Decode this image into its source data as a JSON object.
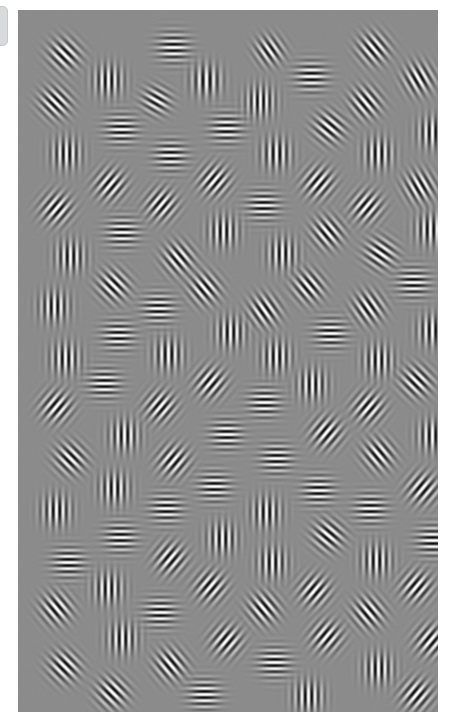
{
  "app": {
    "title": "Gabor Patch Stimulus Display",
    "screen_width": 458,
    "screen_height": 719
  },
  "edge_tab": {
    "name": "drawer-handle",
    "fill_color": "#d9dade",
    "border_color": "#c6c8cc",
    "x": -6,
    "y": 6,
    "width": 14,
    "height": 40,
    "radius": 5
  },
  "stimulus": {
    "name": "gabor-field",
    "x": 18,
    "y": 10,
    "width": 420,
    "height": 702,
    "background_color": "#8b8b8b",
    "background_luminance": 139,
    "contrast": 0.95,
    "patch_sigma": 9.5,
    "patch_wavelength": 7.0,
    "patch_count": 96,
    "orientation_unit": "degrees_clockwise_from_vertical",
    "note": "Jittered grid of oriented Gabor patches (sinusoidal grating x Gaussian envelope) on uniform mid-gray field.",
    "patches": [
      {
        "x": 46,
        "y": 44,
        "deg": 135,
        "sigma": 10,
        "lambda": 7.0,
        "contrast": 0.95,
        "phase": 0
      },
      {
        "x": 155,
        "y": 37,
        "deg": 90,
        "sigma": 10,
        "lambda": 6.4,
        "contrast": 0.95,
        "phase": 0
      },
      {
        "x": 251,
        "y": 40,
        "deg": 145,
        "sigma": 9,
        "lambda": 6.6,
        "contrast": 0.9,
        "phase": 0
      },
      {
        "x": 355,
        "y": 38,
        "deg": 140,
        "sigma": 10,
        "lambda": 6.8,
        "contrast": 0.95,
        "phase": 0
      },
      {
        "x": 90,
        "y": 70,
        "deg": 0,
        "sigma": 10,
        "lambda": 6.6,
        "contrast": 0.95,
        "phase": 0
      },
      {
        "x": 188,
        "y": 70,
        "deg": 0,
        "sigma": 10,
        "lambda": 7.2,
        "contrast": 0.95,
        "phase": 0
      },
      {
        "x": 293,
        "y": 66,
        "deg": 90,
        "sigma": 10,
        "lambda": 6.6,
        "contrast": 0.95,
        "phase": 0
      },
      {
        "x": 400,
        "y": 68,
        "deg": 150,
        "sigma": 10,
        "lambda": 6.8,
        "contrast": 0.95,
        "phase": 0
      },
      {
        "x": 37,
        "y": 92,
        "deg": 135,
        "sigma": 10,
        "lambda": 6.6,
        "contrast": 0.95,
        "phase": 0
      },
      {
        "x": 138,
        "y": 90,
        "deg": 120,
        "sigma": 9,
        "lambda": 6.6,
        "contrast": 0.9,
        "phase": 0
      },
      {
        "x": 242,
        "y": 91,
        "deg": 0,
        "sigma": 10,
        "lambda": 6.2,
        "contrast": 0.95,
        "phase": 0
      },
      {
        "x": 347,
        "y": 92,
        "deg": 140,
        "sigma": 10,
        "lambda": 6.8,
        "contrast": 0.95,
        "phase": 0
      },
      {
        "x": 103,
        "y": 119,
        "deg": 90,
        "sigma": 10,
        "lambda": 6.2,
        "contrast": 0.95,
        "phase": 0
      },
      {
        "x": 208,
        "y": 118,
        "deg": 90,
        "sigma": 10,
        "lambda": 6.4,
        "contrast": 0.95,
        "phase": 0
      },
      {
        "x": 311,
        "y": 117,
        "deg": 130,
        "sigma": 10,
        "lambda": 6.8,
        "contrast": 0.95,
        "phase": 0
      },
      {
        "x": 414,
        "y": 122,
        "deg": 0,
        "sigma": 10,
        "lambda": 6.6,
        "contrast": 0.95,
        "phase": 0
      },
      {
        "x": 48,
        "y": 143,
        "deg": 0,
        "sigma": 10,
        "lambda": 6.6,
        "contrast": 0.95,
        "phase": 0
      },
      {
        "x": 152,
        "y": 145,
        "deg": 90,
        "sigma": 10,
        "lambda": 6.4,
        "contrast": 0.95,
        "phase": 0
      },
      {
        "x": 258,
        "y": 143,
        "deg": 0,
        "sigma": 10,
        "lambda": 6.8,
        "contrast": 0.95,
        "phase": 0
      },
      {
        "x": 360,
        "y": 143,
        "deg": 0,
        "sigma": 10,
        "lambda": 6.8,
        "contrast": 0.95,
        "phase": 0
      },
      {
        "x": 92,
        "y": 174,
        "deg": 40,
        "sigma": 10,
        "lambda": 6.8,
        "contrast": 0.95,
        "phase": 0
      },
      {
        "x": 196,
        "y": 170,
        "deg": 40,
        "sigma": 10,
        "lambda": 6.6,
        "contrast": 0.95,
        "phase": 0
      },
      {
        "x": 300,
        "y": 172,
        "deg": 40,
        "sigma": 10,
        "lambda": 6.8,
        "contrast": 0.95,
        "phase": 0
      },
      {
        "x": 401,
        "y": 176,
        "deg": 150,
        "sigma": 10,
        "lambda": 6.6,
        "contrast": 0.95,
        "phase": 0
      },
      {
        "x": 38,
        "y": 198,
        "deg": 40,
        "sigma": 10,
        "lambda": 6.8,
        "contrast": 0.95,
        "phase": 0
      },
      {
        "x": 143,
        "y": 194,
        "deg": 40,
        "sigma": 10,
        "lambda": 6.6,
        "contrast": 0.95,
        "phase": 0
      },
      {
        "x": 245,
        "y": 195,
        "deg": 90,
        "sigma": 10,
        "lambda": 6.2,
        "contrast": 0.95,
        "phase": 0
      },
      {
        "x": 348,
        "y": 196,
        "deg": 40,
        "sigma": 10,
        "lambda": 6.8,
        "contrast": 0.95,
        "phase": 0
      },
      {
        "x": 104,
        "y": 222,
        "deg": 90,
        "sigma": 10,
        "lambda": 6.2,
        "contrast": 0.95,
        "phase": 0
      },
      {
        "x": 205,
        "y": 221,
        "deg": 0,
        "sigma": 10,
        "lambda": 6.6,
        "contrast": 0.95,
        "phase": 0
      },
      {
        "x": 309,
        "y": 222,
        "deg": 140,
        "sigma": 10,
        "lambda": 6.8,
        "contrast": 0.95,
        "phase": 0
      },
      {
        "x": 412,
        "y": 219,
        "deg": 0,
        "sigma": 10,
        "lambda": 6.6,
        "contrast": 0.95,
        "phase": 0
      },
      {
        "x": 52,
        "y": 246,
        "deg": 0,
        "sigma": 10,
        "lambda": 6.6,
        "contrast": 0.95,
        "phase": 0
      },
      {
        "x": 160,
        "y": 248,
        "deg": 140,
        "sigma": 10,
        "lambda": 6.8,
        "contrast": 0.95,
        "phase": 0
      },
      {
        "x": 264,
        "y": 243,
        "deg": 0,
        "sigma": 10,
        "lambda": 6.6,
        "contrast": 0.95,
        "phase": 0
      },
      {
        "x": 362,
        "y": 243,
        "deg": 125,
        "sigma": 10,
        "lambda": 6.8,
        "contrast": 0.95,
        "phase": 0
      },
      {
        "x": 95,
        "y": 275,
        "deg": 135,
        "sigma": 10,
        "lambda": 6.8,
        "contrast": 0.95,
        "phase": 0
      },
      {
        "x": 186,
        "y": 278,
        "deg": 140,
        "sigma": 10,
        "lambda": 6.8,
        "contrast": 0.95,
        "phase": 0
      },
      {
        "x": 290,
        "y": 276,
        "deg": 140,
        "sigma": 10,
        "lambda": 6.8,
        "contrast": 0.95,
        "phase": 0
      },
      {
        "x": 395,
        "y": 272,
        "deg": 90,
        "sigma": 10,
        "lambda": 6.2,
        "contrast": 0.95,
        "phase": 0
      },
      {
        "x": 36,
        "y": 296,
        "deg": 0,
        "sigma": 10,
        "lambda": 6.6,
        "contrast": 0.95,
        "phase": 0
      },
      {
        "x": 140,
        "y": 298,
        "deg": 90,
        "sigma": 10,
        "lambda": 6.2,
        "contrast": 0.95,
        "phase": 0
      },
      {
        "x": 246,
        "y": 300,
        "deg": 145,
        "sigma": 10,
        "lambda": 6.8,
        "contrast": 0.95,
        "phase": 0
      },
      {
        "x": 350,
        "y": 297,
        "deg": 145,
        "sigma": 10,
        "lambda": 6.8,
        "contrast": 0.95,
        "phase": 0
      },
      {
        "x": 100,
        "y": 325,
        "deg": 90,
        "sigma": 10,
        "lambda": 6.2,
        "contrast": 0.95,
        "phase": 0
      },
      {
        "x": 212,
        "y": 322,
        "deg": 0,
        "sigma": 10,
        "lambda": 6.6,
        "contrast": 0.95,
        "phase": 0
      },
      {
        "x": 312,
        "y": 323,
        "deg": 90,
        "sigma": 10,
        "lambda": 6.2,
        "contrast": 0.95,
        "phase": 0
      },
      {
        "x": 414,
        "y": 320,
        "deg": 0,
        "sigma": 10,
        "lambda": 6.6,
        "contrast": 0.95,
        "phase": 0
      },
      {
        "x": 47,
        "y": 348,
        "deg": 0,
        "sigma": 10,
        "lambda": 6.6,
        "contrast": 0.95,
        "phase": 0
      },
      {
        "x": 150,
        "y": 344,
        "deg": 0,
        "sigma": 10,
        "lambda": 6.8,
        "contrast": 0.95,
        "phase": 0
      },
      {
        "x": 258,
        "y": 346,
        "deg": 0,
        "sigma": 10,
        "lambda": 6.6,
        "contrast": 0.95,
        "phase": 0
      },
      {
        "x": 360,
        "y": 350,
        "deg": 0,
        "sigma": 10,
        "lambda": 6.6,
        "contrast": 0.95,
        "phase": 0
      },
      {
        "x": 86,
        "y": 373,
        "deg": 90,
        "sigma": 10,
        "lambda": 6.2,
        "contrast": 0.95,
        "phase": 0
      },
      {
        "x": 192,
        "y": 372,
        "deg": 40,
        "sigma": 10,
        "lambda": 6.8,
        "contrast": 0.95,
        "phase": 0
      },
      {
        "x": 294,
        "y": 374,
        "deg": 0,
        "sigma": 10,
        "lambda": 6.6,
        "contrast": 0.95,
        "phase": 0
      },
      {
        "x": 398,
        "y": 371,
        "deg": 135,
        "sigma": 10,
        "lambda": 6.8,
        "contrast": 0.95,
        "phase": 0
      },
      {
        "x": 38,
        "y": 396,
        "deg": 40,
        "sigma": 10,
        "lambda": 6.8,
        "contrast": 0.95,
        "phase": 0
      },
      {
        "x": 142,
        "y": 396,
        "deg": 40,
        "sigma": 10,
        "lambda": 6.6,
        "contrast": 0.95,
        "phase": 0
      },
      {
        "x": 246,
        "y": 392,
        "deg": 90,
        "sigma": 10,
        "lambda": 6.2,
        "contrast": 0.95,
        "phase": 0
      },
      {
        "x": 350,
        "y": 397,
        "deg": 40,
        "sigma": 10,
        "lambda": 6.8,
        "contrast": 0.95,
        "phase": 0
      },
      {
        "x": 106,
        "y": 425,
        "deg": 0,
        "sigma": 10,
        "lambda": 6.6,
        "contrast": 0.95,
        "phase": 0
      },
      {
        "x": 208,
        "y": 424,
        "deg": 90,
        "sigma": 10,
        "lambda": 6.2,
        "contrast": 0.95,
        "phase": 0
      },
      {
        "x": 308,
        "y": 422,
        "deg": 40,
        "sigma": 10,
        "lambda": 6.8,
        "contrast": 0.95,
        "phase": 0
      },
      {
        "x": 414,
        "y": 425,
        "deg": 0,
        "sigma": 10,
        "lambda": 6.6,
        "contrast": 0.95,
        "phase": 0
      },
      {
        "x": 52,
        "y": 448,
        "deg": 135,
        "sigma": 10,
        "lambda": 6.8,
        "contrast": 0.95,
        "phase": 0
      },
      {
        "x": 155,
        "y": 450,
        "deg": 40,
        "sigma": 10,
        "lambda": 6.8,
        "contrast": 0.95,
        "phase": 0
      },
      {
        "x": 258,
        "y": 448,
        "deg": 90,
        "sigma": 10,
        "lambda": 6.2,
        "contrast": 0.95,
        "phase": 0
      },
      {
        "x": 360,
        "y": 444,
        "deg": 140,
        "sigma": 10,
        "lambda": 6.8,
        "contrast": 0.95,
        "phase": 0
      },
      {
        "x": 96,
        "y": 478,
        "deg": 0,
        "sigma": 10,
        "lambda": 6.6,
        "contrast": 0.95,
        "phase": 0
      },
      {
        "x": 196,
        "y": 476,
        "deg": 90,
        "sigma": 10,
        "lambda": 6.2,
        "contrast": 0.95,
        "phase": 0
      },
      {
        "x": 300,
        "y": 480,
        "deg": 90,
        "sigma": 10,
        "lambda": 6.2,
        "contrast": 0.95,
        "phase": 0
      },
      {
        "x": 404,
        "y": 478,
        "deg": 40,
        "sigma": 10,
        "lambda": 6.8,
        "contrast": 0.95,
        "phase": 0
      },
      {
        "x": 38,
        "y": 500,
        "deg": 0,
        "sigma": 10,
        "lambda": 6.6,
        "contrast": 0.95,
        "phase": 0
      },
      {
        "x": 148,
        "y": 498,
        "deg": 90,
        "sigma": 10,
        "lambda": 6.2,
        "contrast": 0.95,
        "phase": 0
      },
      {
        "x": 248,
        "y": 502,
        "deg": 0,
        "sigma": 10,
        "lambda": 6.6,
        "contrast": 0.95,
        "phase": 0
      },
      {
        "x": 352,
        "y": 498,
        "deg": 90,
        "sigma": 10,
        "lambda": 6.2,
        "contrast": 0.95,
        "phase": 0
      },
      {
        "x": 102,
        "y": 527,
        "deg": 90,
        "sigma": 10,
        "lambda": 6.2,
        "contrast": 0.95,
        "phase": 0
      },
      {
        "x": 204,
        "y": 528,
        "deg": 0,
        "sigma": 10,
        "lambda": 6.6,
        "contrast": 0.95,
        "phase": 0
      },
      {
        "x": 310,
        "y": 525,
        "deg": 130,
        "sigma": 10,
        "lambda": 6.8,
        "contrast": 0.95,
        "phase": 0
      },
      {
        "x": 414,
        "y": 530,
        "deg": 90,
        "sigma": 10,
        "lambda": 6.2,
        "contrast": 0.95,
        "phase": 0
      },
      {
        "x": 50,
        "y": 552,
        "deg": 90,
        "sigma": 10,
        "lambda": 6.2,
        "contrast": 0.95,
        "phase": 0
      },
      {
        "x": 152,
        "y": 548,
        "deg": 40,
        "sigma": 10,
        "lambda": 6.8,
        "contrast": 0.95,
        "phase": 0
      },
      {
        "x": 254,
        "y": 552,
        "deg": 0,
        "sigma": 10,
        "lambda": 6.6,
        "contrast": 0.95,
        "phase": 0
      },
      {
        "x": 358,
        "y": 550,
        "deg": 0,
        "sigma": 10,
        "lambda": 6.6,
        "contrast": 0.95,
        "phase": 0
      },
      {
        "x": 90,
        "y": 578,
        "deg": 0,
        "sigma": 10,
        "lambda": 6.6,
        "contrast": 0.95,
        "phase": 0
      },
      {
        "x": 192,
        "y": 576,
        "deg": 40,
        "sigma": 10,
        "lambda": 6.8,
        "contrast": 0.95,
        "phase": 0
      },
      {
        "x": 296,
        "y": 580,
        "deg": 40,
        "sigma": 10,
        "lambda": 6.8,
        "contrast": 0.95,
        "phase": 0
      },
      {
        "x": 398,
        "y": 576,
        "deg": 40,
        "sigma": 10,
        "lambda": 6.8,
        "contrast": 0.95,
        "phase": 0
      },
      {
        "x": 38,
        "y": 598,
        "deg": 140,
        "sigma": 10,
        "lambda": 6.8,
        "contrast": 0.95,
        "phase": 0
      },
      {
        "x": 142,
        "y": 602,
        "deg": 90,
        "sigma": 10,
        "lambda": 6.2,
        "contrast": 0.95,
        "phase": 0
      },
      {
        "x": 245,
        "y": 598,
        "deg": 140,
        "sigma": 10,
        "lambda": 6.8,
        "contrast": 0.95,
        "phase": 0
      },
      {
        "x": 350,
        "y": 602,
        "deg": 140,
        "sigma": 10,
        "lambda": 6.8,
        "contrast": 0.95,
        "phase": 0
      },
      {
        "x": 104,
        "y": 628,
        "deg": 0,
        "sigma": 10,
        "lambda": 6.6,
        "contrast": 0.95,
        "phase": 0
      },
      {
        "x": 208,
        "y": 630,
        "deg": 40,
        "sigma": 10,
        "lambda": 6.8,
        "contrast": 0.95,
        "phase": 0
      },
      {
        "x": 308,
        "y": 626,
        "deg": 40,
        "sigma": 10,
        "lambda": 6.8,
        "contrast": 0.95,
        "phase": 0
      },
      {
        "x": 412,
        "y": 630,
        "deg": 40,
        "sigma": 10,
        "lambda": 6.8,
        "contrast": 0.95,
        "phase": 0
      },
      {
        "x": 46,
        "y": 656,
        "deg": 135,
        "sigma": 10,
        "lambda": 6.8,
        "contrast": 0.95,
        "phase": 0
      },
      {
        "x": 152,
        "y": 654,
        "deg": 140,
        "sigma": 10,
        "lambda": 6.8,
        "contrast": 0.95,
        "phase": 0
      },
      {
        "x": 256,
        "y": 652,
        "deg": 90,
        "sigma": 10,
        "lambda": 6.2,
        "contrast": 0.95,
        "phase": 0
      },
      {
        "x": 360,
        "y": 658,
        "deg": 0,
        "sigma": 10,
        "lambda": 6.6,
        "contrast": 0.95,
        "phase": 0
      },
      {
        "x": 94,
        "y": 682,
        "deg": 135,
        "sigma": 10,
        "lambda": 6.8,
        "contrast": 0.95,
        "phase": 0
      },
      {
        "x": 186,
        "y": 684,
        "deg": 90,
        "sigma": 10,
        "lambda": 6.2,
        "contrast": 0.95,
        "phase": 0
      },
      {
        "x": 290,
        "y": 686,
        "deg": 0,
        "sigma": 10,
        "lambda": 6.6,
        "contrast": 0.95,
        "phase": 0
      },
      {
        "x": 398,
        "y": 684,
        "deg": 40,
        "sigma": 10,
        "lambda": 6.8,
        "contrast": 0.95,
        "phase": 0
      }
    ]
  }
}
